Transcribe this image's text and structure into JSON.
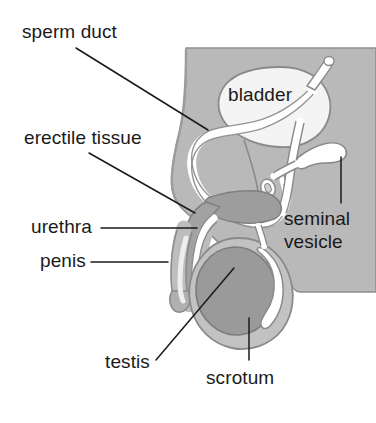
{
  "diagram": {
    "type": "anatomical-cross-section",
    "background_color": "#ffffff",
    "colors": {
      "body_fill": "#b9b9b9",
      "body_stroke": "#8e8e8e",
      "bladder_fill": "#f4f4f4",
      "bladder_stroke": "#8a8a8a",
      "duct_fill": "#ffffff",
      "duct_stroke": "#8a8a8a",
      "testis_fill": "#9a9a9a",
      "testis_stroke": "#7d7d7d",
      "scrotum_fill": "#c2c2c2",
      "scrotum_stroke": "#8a8a8a",
      "erectile_fill": "#a0a0a0",
      "erectile_stroke": "#7f7f7f",
      "leader_line": "#1a1a1a",
      "label_text": "#1a1a1a"
    },
    "labels": [
      {
        "id": "sperm-duct",
        "text": "sperm duct",
        "x": 22,
        "y": 22,
        "align": "left"
      },
      {
        "id": "erectile-tissue",
        "text": "erectile tissue",
        "x": 24,
        "y": 128,
        "align": "left"
      },
      {
        "id": "urethra",
        "text": "urethra",
        "x": 31,
        "y": 217,
        "align": "left"
      },
      {
        "id": "penis",
        "text": "penis",
        "x": 40,
        "y": 251,
        "align": "left"
      },
      {
        "id": "bladder",
        "text": "bladder",
        "x": 228,
        "y": 85,
        "align": "left"
      },
      {
        "id": "seminal-line-1",
        "text": "seminal",
        "x": 284,
        "y": 209,
        "align": "left"
      },
      {
        "id": "seminal-line-2",
        "text": "vesicle",
        "x": 284,
        "y": 232,
        "align": "left"
      },
      {
        "id": "testis",
        "text": "testis",
        "x": 105,
        "y": 352,
        "align": "left"
      },
      {
        "id": "scrotum",
        "text": "scrotum",
        "x": 206,
        "y": 368,
        "align": "left"
      }
    ],
    "leader_lines": [
      {
        "id": "sperm-duct-leader",
        "x1": 76,
        "y1": 48,
        "x2": 208,
        "y2": 130
      },
      {
        "id": "erectile-tissue-leader",
        "x1": 89,
        "y1": 153,
        "x2": 195,
        "y2": 213
      },
      {
        "id": "urethra-leader",
        "x1": 101,
        "y1": 228,
        "x2": 197,
        "y2": 228
      },
      {
        "id": "penis-leader",
        "x1": 91,
        "y1": 262,
        "x2": 168,
        "y2": 262
      },
      {
        "id": "seminal-vesicle-leader",
        "x1": 341,
        "y1": 157,
        "x2": 341,
        "y2": 203
      },
      {
        "id": "testis-leader",
        "x1": 156,
        "y1": 360,
        "x2": 234,
        "y2": 268
      },
      {
        "id": "scrotum-leader",
        "x1": 249,
        "y1": 318,
        "x2": 249,
        "y2": 360
      }
    ],
    "structures": [
      {
        "id": "body-outline",
        "name": "body cross-section"
      },
      {
        "id": "bladder-shape",
        "name": "bladder"
      },
      {
        "id": "sperm-duct-tube",
        "name": "sperm duct (vas deferens)"
      },
      {
        "id": "urethra-tube",
        "name": "urethra"
      },
      {
        "id": "seminal-vesicle-shape",
        "name": "seminal vesicle"
      },
      {
        "id": "prostate-shape",
        "name": "prostate"
      },
      {
        "id": "erectile-tissue-shape",
        "name": "erectile tissue"
      },
      {
        "id": "penis-shape",
        "name": "penis"
      },
      {
        "id": "scrotum-shape",
        "name": "scrotum"
      },
      {
        "id": "testis-shape",
        "name": "testis"
      },
      {
        "id": "epididymis-shape",
        "name": "epididymis"
      }
    ]
  }
}
